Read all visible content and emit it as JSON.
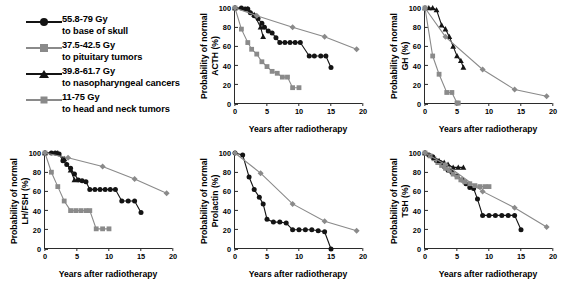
{
  "legend": {
    "name": "radiotherapy-dose-legend",
    "items": [
      {
        "marker": "circle",
        "color": "#141414",
        "dose": "55.8-79 Gy",
        "target": "to base of skull"
      },
      {
        "marker": "square",
        "color": "#8a8a8a",
        "dose": "37.5-42.5 Gy",
        "target": "to pituitary tumors"
      },
      {
        "marker": "triangle",
        "color": "#141414",
        "dose": "39.8-61.7 Gy",
        "target": "to nasopharyngeal cancers"
      },
      {
        "marker": "diamond",
        "color": "#8a8a8a",
        "dose": "11-75 Gy",
        "target": "to head and neck tumors"
      }
    ]
  },
  "axes": {
    "xlabel": "Years after radiotherapy",
    "xticks": [
      "0",
      "5",
      "10",
      "15",
      "20"
    ],
    "yticks": [
      "0",
      "20",
      "40",
      "60",
      "80",
      "100"
    ],
    "xlim": [
      0,
      20
    ],
    "ylim": [
      0,
      100
    ]
  },
  "chart_data": [
    {
      "id": "acth",
      "type": "line",
      "title": "",
      "ylabel": "Probability of normal\nACTH (%)",
      "xlabel": "Years after radiotherapy",
      "xlim": [
        0,
        20
      ],
      "ylim": [
        0,
        100
      ],
      "xticks": [
        0,
        5,
        10,
        15,
        20
      ],
      "yticks": [
        0,
        20,
        40,
        60,
        80,
        100
      ],
      "grid": false,
      "legend_position": "external-top-left",
      "series": [
        {
          "name": "55.8-79 Gy to base of skull",
          "marker": "circle",
          "color": "#141414",
          "x": [
            0,
            1,
            1.6,
            2,
            2.4,
            3,
            3.6,
            4.2,
            4.6,
            5.2,
            5.8,
            6.4,
            7,
            7.8,
            8.6,
            9.4,
            10.2,
            11.6,
            12.4,
            13.4,
            14.2,
            15
          ],
          "y": [
            100,
            100,
            99,
            99,
            95,
            92,
            89,
            84,
            80,
            76,
            74,
            69,
            64,
            64,
            64,
            64,
            64,
            50,
            50,
            50,
            50,
            38
          ]
        },
        {
          "name": "37.5-42.5 Gy to pituitary tumors",
          "marker": "square",
          "color": "#8a8a8a",
          "x": [
            0,
            1,
            2,
            2.6,
            3.4,
            4.2,
            5,
            5.8,
            6.6,
            7.4,
            8.2,
            9,
            10
          ],
          "y": [
            100,
            78,
            64,
            57,
            52,
            44,
            39,
            34,
            32,
            28,
            28,
            17,
            17
          ]
        },
        {
          "name": "39.8-61.7 Gy to nasopharyngeal cancers",
          "marker": "triangle",
          "color": "#141414",
          "x": [
            0,
            2,
            3,
            4,
            4.4
          ],
          "y": [
            100,
            99,
            93,
            80,
            70
          ]
        },
        {
          "name": "11-75 Gy to head and neck tumors",
          "marker": "diamond",
          "color": "#8a8a8a",
          "x": [
            0,
            3.4,
            9,
            14,
            19
          ],
          "y": [
            100,
            92,
            80,
            70,
            57
          ]
        }
      ]
    },
    {
      "id": "gh",
      "type": "line",
      "title": "",
      "ylabel": "Probability of normal\nGH (%)",
      "xlabel": "Years after radiotherapy",
      "xlim": [
        0,
        20
      ],
      "ylim": [
        0,
        100
      ],
      "xticks": [
        0,
        5,
        10,
        15,
        20
      ],
      "yticks": [
        0,
        20,
        40,
        60,
        80,
        100
      ],
      "grid": false,
      "series": [
        {
          "name": "39.8-61.7 Gy to nasopharyngeal cancers",
          "marker": "triangle",
          "color": "#141414",
          "x": [
            0,
            0.6,
            1.2,
            1.8,
            2.6,
            3.2,
            3.8,
            4.4,
            5,
            5.6,
            6
          ],
          "y": [
            100,
            100,
            100,
            98,
            82,
            78,
            70,
            60,
            50,
            45,
            38
          ]
        },
        {
          "name": "37.5-42.5 Gy to pituitary tumors",
          "marker": "square",
          "color": "#8a8a8a",
          "x": [
            0,
            1.2,
            2.2,
            3.4,
            4.2,
            5,
            5.2
          ],
          "y": [
            100,
            50,
            31,
            12,
            12,
            1,
            1
          ]
        },
        {
          "name": "11-75 Gy to head and neck tumors",
          "marker": "diamond",
          "color": "#8a8a8a",
          "x": [
            0,
            3.2,
            9,
            14,
            19
          ],
          "y": [
            100,
            70,
            36,
            15,
            8
          ]
        }
      ]
    },
    {
      "id": "lhfsh",
      "type": "line",
      "title": "",
      "ylabel": "Probability of normal\nLH/FSH (%)",
      "xlabel": "Years after radiotherapy",
      "xlim": [
        0,
        20
      ],
      "ylim": [
        0,
        100
      ],
      "xticks": [
        0,
        5,
        10,
        15,
        20
      ],
      "yticks": [
        0,
        20,
        40,
        60,
        80,
        100
      ],
      "grid": false,
      "series": [
        {
          "name": "55.8-79 Gy to base of skull",
          "marker": "circle",
          "color": "#141414",
          "x": [
            0,
            1,
            1.6,
            2.2,
            2.8,
            3.4,
            4,
            4.6,
            5.2,
            5.8,
            6.4,
            7,
            7.8,
            8.6,
            9.4,
            10.2,
            11,
            12,
            13,
            14,
            15
          ],
          "y": [
            100,
            100,
            100,
            99,
            92,
            88,
            84,
            78,
            72,
            71,
            70,
            62,
            62,
            62,
            62,
            62,
            62,
            50,
            50,
            50,
            38
          ]
        },
        {
          "name": "37.5-42.5 Gy to pituitary tumors",
          "marker": "square",
          "color": "#8a8a8a",
          "x": [
            0,
            1,
            2,
            3,
            4,
            4.8,
            5.6,
            6.4,
            7,
            8,
            9,
            10
          ],
          "y": [
            100,
            80,
            65,
            50,
            40,
            40,
            40,
            40,
            40,
            21,
            21,
            21
          ]
        },
        {
          "name": "39.8-61.7 Gy to nasopharyngeal cancers",
          "marker": "triangle",
          "color": "#141414",
          "x": [
            0,
            2,
            3,
            4,
            4.6
          ],
          "y": [
            100,
            100,
            94,
            82,
            72
          ]
        },
        {
          "name": "11-75 Gy to head and neck tumors",
          "marker": "diamond",
          "color": "#8a8a8a",
          "x": [
            0,
            3.6,
            9,
            14,
            19
          ],
          "y": [
            100,
            95,
            86,
            73,
            58
          ]
        }
      ]
    },
    {
      "id": "prolactin",
      "type": "line",
      "title": "",
      "ylabel": "Probability of normal\nProlactin (%)",
      "xlabel": "Years after radiotherapy",
      "xlim": [
        0,
        20
      ],
      "ylim": [
        0,
        100
      ],
      "xticks": [
        0,
        5,
        10,
        15,
        20
      ],
      "yticks": [
        0,
        20,
        40,
        60,
        80,
        100
      ],
      "grid": false,
      "series": [
        {
          "name": "55.8-79 Gy to base of skull",
          "marker": "circle",
          "color": "#141414",
          "x": [
            0,
            1.2,
            2.2,
            3,
            3.8,
            4.4,
            5,
            6,
            7,
            8,
            9,
            10,
            11,
            12,
            13,
            14,
            15
          ],
          "y": [
            100,
            98,
            75,
            62,
            54,
            47,
            31,
            28,
            28,
            27,
            20,
            20,
            20,
            20,
            19,
            18,
            0
          ]
        },
        {
          "name": "11-75 Gy to head and neck tumors",
          "marker": "diamond",
          "color": "#8a8a8a",
          "x": [
            0,
            4,
            9,
            14,
            19
          ],
          "y": [
            100,
            79,
            47,
            29,
            19
          ]
        }
      ]
    },
    {
      "id": "tsh",
      "type": "line",
      "title": "",
      "ylabel": "Probability of normal\nTSH (%)",
      "xlabel": "Years after radiotherapy",
      "xlim": [
        0,
        20
      ],
      "ylim": [
        0,
        100
      ],
      "xticks": [
        0,
        5,
        10,
        15,
        20
      ],
      "yticks": [
        0,
        20,
        40,
        60,
        80,
        100
      ],
      "grid": false,
      "series": [
        {
          "name": "55.8-79 Gy to base of skull",
          "marker": "circle",
          "color": "#141414",
          "x": [
            0,
            0.6,
            1.2,
            1.8,
            2.4,
            3,
            3.6,
            4.2,
            5,
            5.8,
            6.4,
            7,
            7.6,
            8.2,
            9,
            10,
            11,
            12,
            13,
            14,
            15
          ],
          "y": [
            100,
            98,
            96,
            92,
            90,
            86,
            82,
            80,
            76,
            72,
            68,
            64,
            63,
            52,
            35,
            35,
            35,
            35,
            35,
            35,
            20
          ]
        },
        {
          "name": "37.5-42.5 Gy to pituitary tumors",
          "marker": "square",
          "color": "#8a8a8a",
          "x": [
            0,
            0.8,
            1.4,
            2,
            2.6,
            3.2,
            3.8,
            4.4,
            5,
            5.6,
            6.2,
            7,
            7.8,
            8.6,
            9.4,
            10
          ],
          "y": [
            100,
            97,
            94,
            90,
            87,
            84,
            82,
            78,
            75,
            72,
            70,
            68,
            66,
            65,
            65,
            65
          ]
        },
        {
          "name": "39.8-61.7 Gy to nasopharyngeal cancers",
          "marker": "triangle",
          "color": "#141414",
          "x": [
            0,
            1.4,
            2.2,
            3,
            3.6,
            4.4,
            5.2,
            6
          ],
          "y": [
            100,
            95,
            92,
            90,
            88,
            85,
            85,
            85
          ]
        },
        {
          "name": "11-75 Gy to head and neck tumors",
          "marker": "diamond",
          "color": "#8a8a8a",
          "x": [
            0,
            3.2,
            9,
            14,
            19
          ],
          "y": [
            100,
            88,
            60,
            43,
            23
          ]
        }
      ]
    }
  ]
}
